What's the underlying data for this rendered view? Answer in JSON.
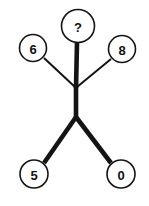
{
  "diagram": {
    "type": "tree-graph",
    "title": "",
    "background_color": "#ffffff",
    "stroke_color": "#141414",
    "node_fill_color": "#ffffff",
    "canvas": {
      "width": 149,
      "height": 206
    },
    "nodes": [
      {
        "id": "n-question",
        "label": "?",
        "cx": 78,
        "cy": 26,
        "r": 16.5,
        "position": "top-center"
      },
      {
        "id": "n-six",
        "label": "6",
        "cx": 33,
        "cy": 48,
        "r": 13.5,
        "position": "upper-left"
      },
      {
        "id": "n-eight",
        "label": "8",
        "cx": 122,
        "cy": 49,
        "r": 13.5,
        "position": "upper-right"
      },
      {
        "id": "n-five",
        "label": "5",
        "cx": 34,
        "cy": 174,
        "r": 14.0,
        "position": "lower-left"
      },
      {
        "id": "n-zero",
        "label": "0",
        "cx": 121,
        "cy": 174,
        "r": 14.0,
        "position": "lower-right"
      }
    ],
    "junctions": [
      {
        "id": "j-upper",
        "x": 76,
        "y": 86
      },
      {
        "id": "j-lower",
        "x": 76,
        "y": 117
      }
    ],
    "edges": [
      {
        "id": "edge-question-to-upper-junction",
        "from": "n-question",
        "to": "j-upper",
        "x1": 77,
        "y1": 43,
        "x2": 76,
        "y2": 88,
        "weight": "thick"
      },
      {
        "id": "edge-six-to-upper-junction",
        "from": "n-six",
        "to": "j-upper",
        "x1": 44,
        "y1": 58,
        "x2": 75,
        "y2": 87,
        "weight": "thin"
      },
      {
        "id": "edge-eight-to-upper-junction",
        "from": "n-eight",
        "to": "j-upper",
        "x1": 111,
        "y1": 59,
        "x2": 77,
        "y2": 87,
        "weight": "thin"
      },
      {
        "id": "edge-upper-to-lower-junction",
        "from": "j-upper",
        "to": "j-lower",
        "x1": 76,
        "y1": 85,
        "x2": 76,
        "y2": 119,
        "weight": "thick"
      },
      {
        "id": "edge-lower-junction-to-five",
        "from": "j-lower",
        "to": "n-five",
        "x1": 76,
        "y1": 117,
        "x2": 44,
        "y2": 163,
        "weight": "thick"
      },
      {
        "id": "edge-lower-junction-to-zero",
        "from": "j-lower",
        "to": "n-zero",
        "x1": 76,
        "y1": 117,
        "x2": 111,
        "y2": 163,
        "weight": "thick"
      }
    ]
  }
}
